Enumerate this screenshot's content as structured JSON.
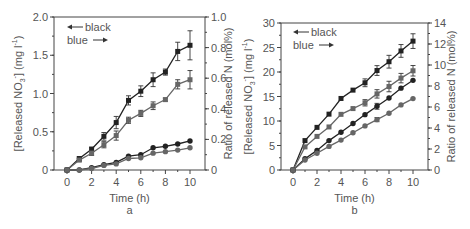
{
  "chart_data": [
    {
      "panel": "a",
      "type": "line",
      "x": [
        0,
        1,
        2,
        3,
        4,
        5,
        6,
        7,
        8,
        9,
        10
      ],
      "xlabel": "Time (h)",
      "ylabel_left": "[Released NO3-] (mg l-1)",
      "ylabel_right": "Ratio of released N (mol%)",
      "xlim": [
        -1,
        11
      ],
      "ylim_left": [
        0,
        2.0
      ],
      "ylim_right": [
        0,
        1.0
      ],
      "xticks": [
        "0",
        "2",
        "4",
        "6",
        "8",
        "10"
      ],
      "yticks_left": [
        "0",
        "0.5",
        "1.0",
        "1.5",
        "2.0"
      ],
      "yticks_right": [
        "0",
        "0.2",
        "0.4",
        "0.6",
        "0.8",
        "1.0"
      ],
      "legend": [
        {
          "label": "black",
          "arrow": "left",
          "axis": "left"
        },
        {
          "label": "blue",
          "arrow": "right",
          "axis": "right"
        }
      ],
      "series": [
        {
          "name": "black-squares",
          "axis": "left",
          "marker": "square",
          "color": "#222222",
          "values": [
            0,
            0.15,
            0.27,
            0.44,
            0.62,
            0.91,
            1.03,
            1.18,
            1.28,
            1.55,
            1.63
          ],
          "errors": [
            0,
            0.02,
            0.03,
            0.05,
            0.08,
            0.06,
            0.07,
            0.09,
            0.04,
            0.12,
            0.19
          ]
        },
        {
          "name": "blue-squares",
          "axis": "right",
          "marker": "square",
          "color": "#666666",
          "values": [
            0,
            0.065,
            0.11,
            0.165,
            0.225,
            0.325,
            0.37,
            0.42,
            0.46,
            0.56,
            0.59
          ],
          "errors": [
            0,
            0.01,
            0.015,
            0.02,
            0.03,
            0.02,
            0.02,
            0.025,
            0.01,
            0.03,
            0.06
          ]
        },
        {
          "name": "black-circles",
          "axis": "left",
          "marker": "circle",
          "color": "#222222",
          "values": [
            0,
            0,
            0.03,
            0.07,
            0.1,
            0.18,
            0.2,
            0.29,
            0.31,
            0.34,
            0.38
          ],
          "errors": [
            0,
            0,
            0,
            0,
            0,
            0,
            0,
            0,
            0,
            0,
            0
          ]
        },
        {
          "name": "blue-circles",
          "axis": "right",
          "marker": "circle",
          "color": "#666666",
          "values": [
            0,
            0,
            0.01,
            0.03,
            0.04,
            0.075,
            0.08,
            0.11,
            0.12,
            0.13,
            0.145
          ],
          "errors": [
            0,
            0,
            0,
            0,
            0,
            0,
            0,
            0,
            0,
            0,
            0
          ]
        }
      ],
      "caption": "a"
    },
    {
      "panel": "b",
      "type": "line",
      "x": [
        0,
        1,
        2,
        3,
        4,
        5,
        6,
        7,
        8,
        9,
        10
      ],
      "xlabel": "Time (h)",
      "ylabel_left": "[Released NO3-] (mg l-1)",
      "ylabel_right": "Ratio of released N (mol%)",
      "xlim": [
        -1,
        11
      ],
      "ylim_left": [
        0,
        30
      ],
      "ylim_right": [
        0,
        14
      ],
      "xticks": [
        "0",
        "2",
        "4",
        "6",
        "8",
        "10"
      ],
      "yticks_left": [
        "0",
        "5",
        "10",
        "15",
        "20",
        "25",
        "30"
      ],
      "yticks_right": [
        "0",
        "2",
        "4",
        "6",
        "8",
        "10",
        "12",
        "14"
      ],
      "legend": [
        {
          "label": "black",
          "arrow": "left",
          "axis": "left"
        },
        {
          "label": "blue",
          "arrow": "right",
          "axis": "right"
        }
      ],
      "series": [
        {
          "name": "black-squares",
          "axis": "left",
          "marker": "square",
          "color": "#222222",
          "values": [
            0,
            6.0,
            8.7,
            11.4,
            14.6,
            16.3,
            17.8,
            20.3,
            22.1,
            24.3,
            26.3
          ],
          "errors": [
            0,
            0,
            0,
            0,
            0,
            0,
            0.8,
            1.0,
            1.3,
            1.3,
            1.5
          ]
        },
        {
          "name": "blue-squares",
          "axis": "right",
          "marker": "square",
          "color": "#666666",
          "values": [
            0,
            2.2,
            3.2,
            4.1,
            5.3,
            5.85,
            6.4,
            7.25,
            7.95,
            8.75,
            9.45
          ],
          "errors": [
            0,
            0,
            0,
            0,
            0,
            0,
            0.3,
            0.4,
            0.5,
            0.45,
            0.5
          ]
        },
        {
          "name": "black-circles",
          "axis": "left",
          "marker": "circle",
          "color": "#222222",
          "values": [
            0,
            2.3,
            4.0,
            6.0,
            7.7,
            9.5,
            11.3,
            13.0,
            14.7,
            16.7,
            18.3
          ],
          "errors": [
            0,
            0,
            0,
            0,
            0,
            0,
            0,
            0.6,
            0,
            0,
            0
          ]
        },
        {
          "name": "blue-circles",
          "axis": "right",
          "marker": "circle",
          "color": "#666666",
          "values": [
            0,
            0.95,
            1.6,
            2.25,
            2.85,
            3.55,
            4.2,
            4.8,
            5.4,
            6.2,
            6.8
          ],
          "errors": [
            0,
            0,
            0,
            0,
            0,
            0,
            0,
            0.2,
            0,
            0,
            0
          ]
        }
      ],
      "caption": "b"
    }
  ],
  "labels": {
    "xlabel": "Time (h)",
    "ylabel_left_main": "[Released NO",
    "ylabel_left_sub": "3",
    "ylabel_left_sup": "-",
    "ylabel_left_tail": "] (mg l",
    "ylabel_left_tail_sup": "-1",
    "ylabel_left_end": ")",
    "ylabel_right": "Ratio of released N (mol%)",
    "legend_black": "black",
    "legend_blue": "blue",
    "caption_a": "a",
    "caption_b": "b"
  }
}
